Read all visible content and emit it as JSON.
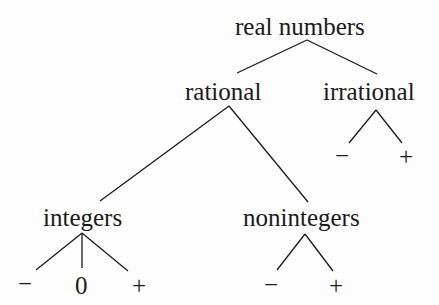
{
  "diagram": {
    "type": "tree",
    "root": {
      "label": "real numbers",
      "children": [
        {
          "label": "rational",
          "children": [
            {
              "label": "integers",
              "children": [
                {
                  "label": "−"
                },
                {
                  "label": "0"
                },
                {
                  "label": "+"
                }
              ]
            },
            {
              "label": "nonintegers",
              "children": [
                {
                  "label": "−"
                },
                {
                  "label": "+"
                }
              ]
            }
          ]
        },
        {
          "label": "irrational",
          "children": [
            {
              "label": "−"
            },
            {
              "label": "+"
            }
          ]
        }
      ]
    }
  },
  "nodes": {
    "real_numbers": "real numbers",
    "rational": "rational",
    "irrational": "irrational",
    "integers": "integers",
    "nonintegers": "nonintegers",
    "integers_neg": "−",
    "integers_zero": "0",
    "integers_pos": "+",
    "nonintegers_neg": "−",
    "nonintegers_pos": "+",
    "irrational_neg": "−",
    "irrational_pos": "+"
  },
  "colors": {
    "ink": "#1a1a1a",
    "background": "#fdfdfd"
  }
}
